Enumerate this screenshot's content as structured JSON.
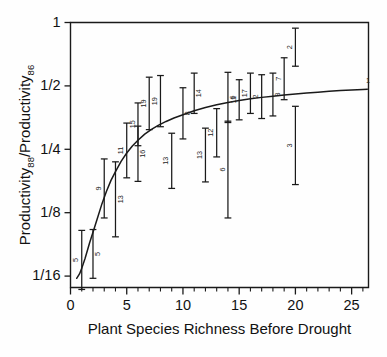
{
  "figure": {
    "background_color": "#fefefe",
    "ink_color": "#1a1a1a"
  },
  "chart_data": {
    "type": "scatter",
    "title": "",
    "subtitle": "",
    "xlabel": "Plant Species Richness Before Drought",
    "ylabel": "Productivity88/Productivity86",
    "ylabel_parts": {
      "lead": "Productivity",
      "sub1": "88",
      "mid": "/Productivity",
      "sub2": "86"
    },
    "xlim": [
      0,
      26.5
    ],
    "ylim_log2": [
      -4.18,
      0.0
    ],
    "yscale": "log2",
    "grid": false,
    "legend": false,
    "legend_position": "none",
    "xticks": [
      0,
      5,
      10,
      15,
      20,
      25
    ],
    "xtick_labels": [
      "0",
      "5",
      "10",
      "15",
      "20",
      "25"
    ],
    "xminor_step": 1,
    "yticks": [
      1,
      0.5,
      0.25,
      0.125,
      0.0625
    ],
    "ytick_labels": [
      "1",
      "1/2",
      "1/4",
      "1/8",
      "1/16"
    ],
    "error_type": "95% confidence interval",
    "point_annotation_meaning": "sample size (number of plots)",
    "points": [
      {
        "x": 1,
        "y": 0.0735,
        "ylow": 0.054,
        "yhigh": 0.103,
        "n": "5",
        "n_side": "left"
      },
      {
        "x": 2,
        "y": 0.08,
        "ylow": 0.061,
        "yhigh": 0.104,
        "n": "5",
        "n_side": "right"
      },
      {
        "x": 3,
        "y": 0.161,
        "ylow": 0.118,
        "yhigh": 0.225,
        "n": "9",
        "n_side": "left"
      },
      {
        "x": 4,
        "y": 0.146,
        "ylow": 0.096,
        "yhigh": 0.218,
        "n": "13",
        "n_side": "right"
      },
      {
        "x": 5,
        "y": 0.247,
        "ylow": 0.183,
        "yhigh": 0.333,
        "n": "11",
        "n_side": "left"
      },
      {
        "x": 6,
        "y": 0.238,
        "ylow": 0.176,
        "yhigh": 0.322,
        "n": "16",
        "n_side": "right"
      },
      {
        "x": 6,
        "y": 0.325,
        "ylow": 0.26,
        "yhigh": 0.415,
        "n": "15",
        "n_side": "left"
      },
      {
        "x": 7,
        "y": 0.41,
        "ylow": 0.31,
        "yhigh": 0.55,
        "n": "19",
        "n_side": "left"
      },
      {
        "x": 8,
        "y": 0.42,
        "ylow": 0.32,
        "yhigh": 0.56,
        "n": "19",
        "n_side": "left"
      },
      {
        "x": 9,
        "y": 0.22,
        "ylow": 0.163,
        "yhigh": 0.298,
        "n": "13",
        "n_side": "left"
      },
      {
        "x": 10,
        "y": 0.37,
        "ylow": 0.28,
        "yhigh": 0.49,
        "n": "8",
        "n_side": "right"
      },
      {
        "x": 11,
        "y": 0.46,
        "ylow": 0.37,
        "yhigh": 0.575,
        "n": "14",
        "n_side": "right"
      },
      {
        "x": 12,
        "y": 0.235,
        "ylow": 0.175,
        "yhigh": 0.315,
        "n": "13",
        "n_side": "left"
      },
      {
        "x": 13,
        "y": 0.3,
        "ylow": 0.23,
        "yhigh": 0.39,
        "n": "12",
        "n_side": "left"
      },
      {
        "x": 14,
        "y": 0.44,
        "ylow": 0.335,
        "yhigh": 0.58,
        "n": "6",
        "n_side": "right"
      },
      {
        "x": 14,
        "y": 0.2,
        "ylow": 0.118,
        "yhigh": 0.34,
        "n": "6",
        "n_side": "left"
      },
      {
        "x": 15,
        "y": 0.43,
        "ylow": 0.345,
        "yhigh": 0.535,
        "n": "11",
        "n_side": "left"
      },
      {
        "x": 16,
        "y": 0.46,
        "ylow": 0.37,
        "yhigh": 0.575,
        "n": "17",
        "n_side": "left"
      },
      {
        "x": 17,
        "y": 0.445,
        "ylow": 0.35,
        "yhigh": 0.565,
        "n": "2",
        "n_side": "left"
      },
      {
        "x": 18,
        "y": 0.455,
        "ylow": 0.36,
        "yhigh": 0.575,
        "n": "3",
        "n_side": "right"
      },
      {
        "x": 19,
        "y": 0.54,
        "ylow": 0.43,
        "yhigh": 0.68,
        "n": "7",
        "n_side": "left"
      },
      {
        "x": 20,
        "y": 0.76,
        "ylow": 0.62,
        "yhigh": 0.94,
        "n": "2",
        "n_side": "left"
      },
      {
        "x": 20,
        "y": 0.26,
        "ylow": 0.17,
        "yhigh": 0.4,
        "n": "3",
        "n_side": "left"
      },
      {
        "x": 26,
        "y": 0.51,
        "ylow": 0.51,
        "yhigh": 0.51,
        "n": "1",
        "n_side": "right",
        "no_bar": true
      }
    ],
    "fit_curve": {
      "label": "fitted saturating curve",
      "x": [
        0.55,
        0.8,
        1.0,
        1.3,
        1.7,
        2.0,
        2.4,
        2.8,
        3.2,
        3.6,
        4.0,
        4.5,
        5.0,
        5.5,
        6.0,
        6.6,
        7.2,
        7.8,
        8.5,
        9.2,
        10.0,
        11.0,
        12.0,
        13.0,
        14.0,
        15.0,
        16.0,
        17.0,
        18.0,
        19.0,
        20.0,
        21.0,
        22.0,
        23.0,
        24.0,
        25.0,
        26.0,
        26.4
      ],
      "y": [
        0.061,
        0.064,
        0.068,
        0.076,
        0.09,
        0.101,
        0.118,
        0.138,
        0.158,
        0.178,
        0.196,
        0.219,
        0.24,
        0.259,
        0.276,
        0.295,
        0.311,
        0.325,
        0.339,
        0.352,
        0.365,
        0.381,
        0.395,
        0.407,
        0.417,
        0.426,
        0.434,
        0.441,
        0.447,
        0.453,
        0.458,
        0.463,
        0.467,
        0.471,
        0.475,
        0.478,
        0.481,
        0.4825
      ]
    }
  }
}
